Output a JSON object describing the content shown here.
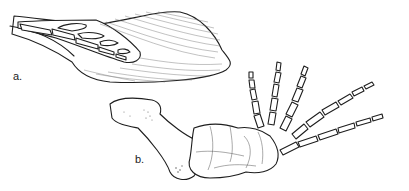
{
  "figure": {
    "panels": [
      {
        "id": "a",
        "label": "a.",
        "subject": "flipper with outline of soft tissue enclosing digit bones"
      },
      {
        "id": "b",
        "label": "b.",
        "subject": "skeleton of forelimb: upper arm bone, carpals and five digits"
      }
    ],
    "colors": {
      "ink": "#1e1e1e",
      "background": "#ffffff"
    }
  }
}
